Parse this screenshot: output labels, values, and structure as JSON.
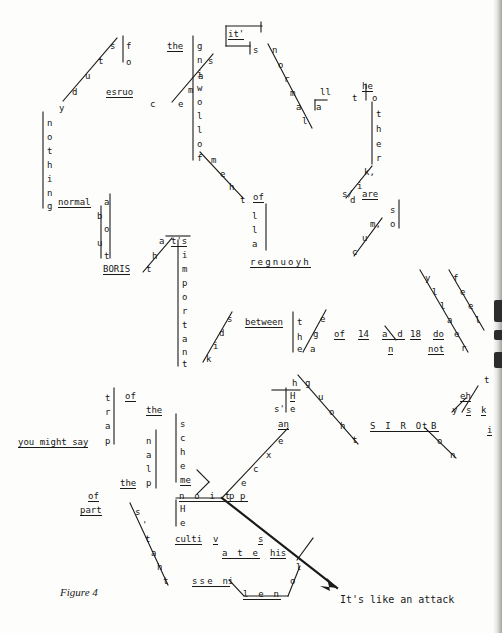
{
  "document": {
    "type": "concrete-poetry-typographic-diagram",
    "caption": "Figure 4",
    "closing_line": "It's like an attack",
    "reconstructed_text": "study of course the same it's normal the following of them all the other kids are, nothing normal about BORIS that's important of the between the age of 14 and 18 do not really feel you might say part of the principal scheme HIS thought He's an exception perception He cultivates his loneliness BORIS think sky It's like an attack",
    "page_size": {
      "width": 502,
      "height": 633
    }
  },
  "glyphs": [
    {
      "id": "g_s_diag_1",
      "text": "s",
      "x": 110,
      "y": 42
    },
    {
      "id": "g_t_diag_1",
      "text": "t",
      "x": 98,
      "y": 57
    },
    {
      "id": "g_u_diag_1",
      "text": "u",
      "x": 85,
      "y": 72
    },
    {
      "id": "g_d_diag_1",
      "text": "d",
      "x": 72,
      "y": 88
    },
    {
      "id": "g_y_diag_1",
      "text": "y",
      "x": 59,
      "y": 104
    },
    {
      "id": "g_f_of",
      "text": "f",
      "x": 126,
      "y": 42
    },
    {
      "id": "g_o_of",
      "text": "o",
      "x": 126,
      "y": 58
    },
    {
      "id": "g_esruoc_w",
      "text": "esruo",
      "x": 106,
      "y": 88
    },
    {
      "id": "g_c_esruoc",
      "text": "c",
      "x": 150,
      "y": 100
    },
    {
      "id": "g_s_same",
      "text": "s",
      "x": 208,
      "y": 57
    },
    {
      "id": "g_a_same",
      "text": "a",
      "x": 198,
      "y": 72
    },
    {
      "id": "g_m_same",
      "text": "m",
      "x": 188,
      "y": 86
    },
    {
      "id": "g_e_same",
      "text": "e",
      "x": 178,
      "y": 100
    },
    {
      "id": "g_the_1",
      "text": "the",
      "x": 167,
      "y": 42
    },
    {
      "id": "g_its_box",
      "text": "it'",
      "x": 228,
      "y": 30
    },
    {
      "id": "g_s_its",
      "text": "s",
      "x": 253,
      "y": 46
    },
    {
      "id": "g_n_normal",
      "text": "n",
      "x": 272,
      "y": 46
    },
    {
      "id": "g_o_normal",
      "text": "o",
      "x": 278,
      "y": 61
    },
    {
      "id": "g_r_normal",
      "text": "r",
      "x": 284,
      "y": 75
    },
    {
      "id": "g_m_normal",
      "text": "m",
      "x": 290,
      "y": 89
    },
    {
      "id": "g_a_normal",
      "text": "a",
      "x": 296,
      "y": 103
    },
    {
      "id": "g_l_normal",
      "text": "l",
      "x": 302,
      "y": 117
    },
    {
      "id": "g_ll",
      "text": "ll",
      "x": 320,
      "y": 88
    },
    {
      "id": "g_a_all",
      "text": "a",
      "x": 316,
      "y": 103
    },
    {
      "id": "g_he_word",
      "text": "he",
      "x": 362,
      "y": 82
    },
    {
      "id": "g_t_the2",
      "text": "t",
      "x": 352,
      "y": 94
    },
    {
      "id": "g_o_other",
      "text": "o",
      "x": 372,
      "y": 94
    },
    {
      "id": "g_t_other",
      "text": "t",
      "x": 376,
      "y": 110
    },
    {
      "id": "g_h_other",
      "text": "h",
      "x": 376,
      "y": 125
    },
    {
      "id": "g_e_other",
      "text": "e",
      "x": 376,
      "y": 140
    },
    {
      "id": "g_r_other",
      "text": "r",
      "x": 376,
      "y": 154
    },
    {
      "id": "g_k_other",
      "text": "k,",
      "x": 364,
      "y": 168
    },
    {
      "id": "g_i_kids",
      "text": "i",
      "x": 357,
      "y": 182
    },
    {
      "id": "g_d_kids",
      "text": "d",
      "x": 350,
      "y": 196
    },
    {
      "id": "g_s_kids",
      "text": "s/",
      "x": 342,
      "y": 190
    },
    {
      "id": "g_are",
      "text": "are",
      "x": 362,
      "y": 190
    },
    {
      "id": "g_s_us",
      "text": "s",
      "x": 390,
      "y": 206
    },
    {
      "id": "g_o_us",
      "text": "o",
      "x": 390,
      "y": 220
    },
    {
      "id": "g_m_much",
      "text": "m,",
      "x": 370,
      "y": 220
    },
    {
      "id": "g_u_much",
      "text": "u",
      "x": 362,
      "y": 234
    },
    {
      "id": "g_c_much",
      "text": "c",
      "x": 352,
      "y": 248
    },
    {
      "id": "g_g_foll",
      "text": "g",
      "x": 197,
      "y": 42
    },
    {
      "id": "g_n_foll",
      "text": "n",
      "x": 197,
      "y": 56
    },
    {
      "id": "g_i_foll",
      "text": "i",
      "x": 197,
      "y": 70
    },
    {
      "id": "g_w_foll",
      "text": "w",
      "x": 197,
      "y": 84
    },
    {
      "id": "g_o_foll",
      "text": "o",
      "x": 197,
      "y": 98
    },
    {
      "id": "g_l1_foll",
      "text": "l",
      "x": 197,
      "y": 112
    },
    {
      "id": "g_l2_foll",
      "text": "l",
      "x": 197,
      "y": 126
    },
    {
      "id": "g_o2_foll",
      "text": "o",
      "x": 197,
      "y": 140
    },
    {
      "id": "g_f_foll",
      "text": "f",
      "x": 197,
      "y": 154
    },
    {
      "id": "g_m_them",
      "text": "m",
      "x": 211,
      "y": 156
    },
    {
      "id": "g_e_them",
      "text": "e",
      "x": 220,
      "y": 170
    },
    {
      "id": "g_h_them",
      "text": "h",
      "x": 229,
      "y": 183
    },
    {
      "id": "g_t_them",
      "text": "t",
      "x": 240,
      "y": 196
    },
    {
      "id": "g_of_2",
      "text": "of",
      "x": 253,
      "y": 193
    },
    {
      "id": "g_l1_all2",
      "text": "l",
      "x": 252,
      "y": 212
    },
    {
      "id": "g_l2_all2",
      "text": "l",
      "x": 252,
      "y": 226
    },
    {
      "id": "g_a_all2",
      "text": "a",
      "x": 252,
      "y": 240
    },
    {
      "id": "g_younger",
      "text": "regnuoyh",
      "x": 250,
      "y": 258
    },
    {
      "id": "g_n_noth",
      "text": "n",
      "x": 47,
      "y": 119
    },
    {
      "id": "g_o_noth",
      "text": "o",
      "x": 47,
      "y": 133
    },
    {
      "id": "g_t_noth",
      "text": "t",
      "x": 47,
      "y": 147
    },
    {
      "id": "g_h_noth",
      "text": "h",
      "x": 47,
      "y": 161
    },
    {
      "id": "g_i_noth",
      "text": "i",
      "x": 47,
      "y": 175
    },
    {
      "id": "g_n2_noth",
      "text": "n",
      "x": 47,
      "y": 189
    },
    {
      "id": "g_g_noth",
      "text": "g",
      "x": 47,
      "y": 202
    },
    {
      "id": "g_normal_w",
      "text": "normal",
      "x": 58,
      "y": 198
    },
    {
      "id": "g_a_about",
      "text": "a",
      "x": 104,
      "y": 198
    },
    {
      "id": "g_b_about",
      "text": "b",
      "x": 97,
      "y": 212
    },
    {
      "id": "g_o_about",
      "text": "o",
      "x": 104,
      "y": 225
    },
    {
      "id": "g_u_about",
      "text": "u",
      "x": 97,
      "y": 239
    },
    {
      "id": "g_t_about",
      "text": "t",
      "x": 104,
      "y": 252
    },
    {
      "id": "g_boris_1",
      "text": "BORIS",
      "x": 103,
      "y": 265
    },
    {
      "id": "g_t_that",
      "text": "t",
      "x": 146,
      "y": 265
    },
    {
      "id": "g_h_that",
      "text": "h",
      "x": 152,
      "y": 252
    },
    {
      "id": "g_a_that",
      "text": "a",
      "x": 159,
      "y": 237
    },
    {
      "id": "g_ts_that",
      "text": "t's",
      "x": 171,
      "y": 237
    },
    {
      "id": "g_i_imp",
      "text": "i",
      "x": 182,
      "y": 251
    },
    {
      "id": "g_m_imp",
      "text": "m",
      "x": 182,
      "y": 265
    },
    {
      "id": "g_p_imp",
      "text": "p",
      "x": 182,
      "y": 279
    },
    {
      "id": "g_o_imp",
      "text": "o",
      "x": 182,
      "y": 293
    },
    {
      "id": "g_r_imp",
      "text": "r",
      "x": 182,
      "y": 307
    },
    {
      "id": "g_t2_imp",
      "text": "t",
      "x": 182,
      "y": 321
    },
    {
      "id": "g_a2_imp",
      "text": "a",
      "x": 182,
      "y": 335
    },
    {
      "id": "g_n_imp",
      "text": "n",
      "x": 182,
      "y": 348
    },
    {
      "id": "g_t3_imp",
      "text": "t",
      "x": 182,
      "y": 360
    },
    {
      "id": "g_s_think",
      "text": "s",
      "x": 227,
      "y": 315
    },
    {
      "id": "g_d_think",
      "text": "d",
      "x": 219,
      "y": 329
    },
    {
      "id": "g_i_think",
      "text": "i",
      "x": 213,
      "y": 342
    },
    {
      "id": "g_k_think",
      "text": "k",
      "x": 206,
      "y": 355
    },
    {
      "id": "g_between",
      "text": "between",
      "x": 245,
      "y": 318
    },
    {
      "id": "g_t_the3",
      "text": "t",
      "x": 297,
      "y": 318
    },
    {
      "id": "g_h_the3",
      "text": "h",
      "x": 297,
      "y": 333
    },
    {
      "id": "g_e_the3",
      "text": "e",
      "x": 297,
      "y": 345
    },
    {
      "id": "g_e_age",
      "text": "e",
      "x": 320,
      "y": 315
    },
    {
      "id": "g_g_age",
      "text": "g",
      "x": 313,
      "y": 330
    },
    {
      "id": "g_a_age",
      "text": "a",
      "x": 310,
      "y": 345
    },
    {
      "id": "g_of_3",
      "text": "of",
      "x": 334,
      "y": 330
    },
    {
      "id": "g_14",
      "text": "14",
      "x": 358,
      "y": 330
    },
    {
      "id": "g_ad",
      "text": "a d",
      "x": 382,
      "y": 330
    },
    {
      "id": "g_n_and",
      "text": "n",
      "x": 388,
      "y": 345
    },
    {
      "id": "g_18",
      "text": "18",
      "x": 410,
      "y": 330
    },
    {
      "id": "g_do",
      "text": "do",
      "x": 433,
      "y": 330
    },
    {
      "id": "g_not",
      "text": "not",
      "x": 428,
      "y": 345
    },
    {
      "id": "g_y_really",
      "text": "y",
      "x": 425,
      "y": 274
    },
    {
      "id": "g_l1_really",
      "text": "l",
      "x": 432,
      "y": 288
    },
    {
      "id": "g_l2_really",
      "text": "l",
      "x": 440,
      "y": 302
    },
    {
      "id": "g_a_really",
      "text": "a",
      "x": 447,
      "y": 316
    },
    {
      "id": "g_e_really",
      "text": "e",
      "x": 454,
      "y": 330
    },
    {
      "id": "g_r_really",
      "text": "r",
      "x": 461,
      "y": 344
    },
    {
      "id": "g_f_feel",
      "text": "f",
      "x": 453,
      "y": 274
    },
    {
      "id": "g_e1_feel",
      "text": "e",
      "x": 460,
      "y": 288
    },
    {
      "id": "g_e2_feel",
      "text": "e",
      "x": 468,
      "y": 302
    },
    {
      "id": "g_l_feel",
      "text": "l",
      "x": 475,
      "y": 316
    },
    {
      "id": "g_t_tail",
      "text": "t",
      "x": 484,
      "y": 376
    },
    {
      "id": "g_eh",
      "text": "eh",
      "x": 460,
      "y": 392
    },
    {
      "id": "g_y_sky",
      "text": "y",
      "x": 452,
      "y": 406
    },
    {
      "id": "g_s_sky",
      "text": "s",
      "x": 466,
      "y": 406
    },
    {
      "id": "g_k_sky",
      "text": "k",
      "x": 481,
      "y": 406
    },
    {
      "id": "g_i_tail",
      "text": "i",
      "x": 487,
      "y": 426
    },
    {
      "id": "g_you_might",
      "text": "you might say",
      "x": 18,
      "y": 438
    },
    {
      "id": "g_t_trap",
      "text": "t",
      "x": 105,
      "y": 394
    },
    {
      "id": "g_r_trap",
      "text": "r",
      "x": 105,
      "y": 408
    },
    {
      "id": "g_a_trap",
      "text": "a",
      "x": 105,
      "y": 422
    },
    {
      "id": "g_p_trap",
      "text": "p",
      "x": 105,
      "y": 437
    },
    {
      "id": "g_of_4",
      "text": "of",
      "x": 125,
      "y": 392
    },
    {
      "id": "g_the_4",
      "text": "the",
      "x": 146,
      "y": 406
    },
    {
      "id": "g_n_prin",
      "text": "n",
      "x": 146,
      "y": 437
    },
    {
      "id": "g_a_prin",
      "text": "a",
      "x": 146,
      "y": 451
    },
    {
      "id": "g_l_prin",
      "text": "l",
      "x": 146,
      "y": 465
    },
    {
      "id": "g_the_5",
      "text": "the",
      "x": 120,
      "y": 479
    },
    {
      "id": "g_p_prin",
      "text": "p",
      "x": 146,
      "y": 479
    },
    {
      "id": "g_of_5",
      "text": "of",
      "x": 88,
      "y": 492
    },
    {
      "id": "g_part",
      "text": "part",
      "x": 80,
      "y": 506
    },
    {
      "id": "g_s_sch",
      "text": "s",
      "x": 180,
      "y": 420
    },
    {
      "id": "g_c_sch",
      "text": "c",
      "x": 180,
      "y": 434
    },
    {
      "id": "g_h_sch",
      "text": "h",
      "x": 180,
      "y": 448
    },
    {
      "id": "g_e_sch",
      "text": "e",
      "x": 180,
      "y": 462
    },
    {
      "id": "g_me_sch",
      "text": "me",
      "x": 180,
      "y": 476
    },
    {
      "id": "g_percep",
      "text": "n o i t p",
      "x": 179,
      "y": 492
    },
    {
      "id": "g_H_he2",
      "text": "H",
      "x": 180,
      "y": 505
    },
    {
      "id": "g_e_he2",
      "text": "e",
      "x": 180,
      "y": 519
    },
    {
      "id": "g_h_thought",
      "text": "h",
      "x": 292,
      "y": 379
    },
    {
      "id": "g_g_thought",
      "text": "g",
      "x": 305,
      "y": 379
    },
    {
      "id": "g_u_thought",
      "text": "u",
      "x": 318,
      "y": 393
    },
    {
      "id": "g_o_thought",
      "text": "o",
      "x": 329,
      "y": 408
    },
    {
      "id": "g_h2_thought",
      "text": "h",
      "x": 340,
      "y": 422
    },
    {
      "id": "g_t_thought",
      "text": "t",
      "x": 352,
      "y": 436
    },
    {
      "id": "g_H_his",
      "text": "H",
      "x": 290,
      "y": 392
    },
    {
      "id": "g_s_hes",
      "text": "s'",
      "x": 274,
      "y": 405
    },
    {
      "id": "g_e_hes",
      "text": "e",
      "x": 290,
      "y": 405
    },
    {
      "id": "g_an",
      "text": "an",
      "x": 278,
      "y": 420
    },
    {
      "id": "g_e_exc",
      "text": "e",
      "x": 278,
      "y": 437
    },
    {
      "id": "g_x_exc",
      "text": "x",
      "x": 266,
      "y": 451
    },
    {
      "id": "g_c_exc",
      "text": "c",
      "x": 253,
      "y": 465
    },
    {
      "id": "g_e2_exc",
      "text": "e",
      "x": 241,
      "y": 479
    },
    {
      "id": "g_p_exc",
      "text": "p",
      "x": 229,
      "y": 492
    },
    {
      "id": "g_boris_2",
      "text": "S I R O B",
      "x": 370,
      "y": 422
    },
    {
      "id": "g_t_boris2",
      "text": "t",
      "x": 422,
      "y": 422
    },
    {
      "id": "g_o_boris2",
      "text": "o",
      "x": 437,
      "y": 437
    },
    {
      "id": "g_n_boris2",
      "text": "n",
      "x": 450,
      "y": 451
    },
    {
      "id": "g_s_thats",
      "text": "s",
      "x": 135,
      "y": 508
    },
    {
      "id": "g_apos",
      "text": "'",
      "x": 142,
      "y": 521
    },
    {
      "id": "g_t_thats",
      "text": "t",
      "x": 145,
      "y": 535
    },
    {
      "id": "g_a_thats",
      "text": "a",
      "x": 151,
      "y": 549
    },
    {
      "id": "g_h_thats",
      "text": "h",
      "x": 157,
      "y": 563
    },
    {
      "id": "g_t2_thats",
      "text": "t",
      "x": 163,
      "y": 577
    },
    {
      "id": "g_culti",
      "text": "culti",
      "x": 175,
      "y": 535
    },
    {
      "id": "g_v_cult",
      "text": "v",
      "x": 213,
      "y": 535
    },
    {
      "id": "g_ate",
      "text": "a t e",
      "x": 222,
      "y": 549
    },
    {
      "id": "g_s_cult",
      "text": "s",
      "x": 258,
      "y": 535
    },
    {
      "id": "g_his",
      "text": "his",
      "x": 270,
      "y": 549
    },
    {
      "id": "g_ssen",
      "text": "sse n",
      "x": 192,
      "y": 577
    },
    {
      "id": "g_i_lone",
      "text": "i",
      "x": 228,
      "y": 577
    },
    {
      "id": "g_len",
      "text": "l e n",
      "x": 243,
      "y": 590
    },
    {
      "id": "g_o_lone",
      "text": "o",
      "x": 290,
      "y": 577
    },
    {
      "id": "g_l_lone",
      "text": "l",
      "x": 296,
      "y": 563
    }
  ],
  "underlined_ids": [
    "g_esruoc_w",
    "g_the_1",
    "g_its_box",
    "g_he_word",
    "g_are",
    "g_of_2",
    "g_younger",
    "g_normal_w",
    "g_boris_1",
    "g_ts_that",
    "g_between",
    "g_of_3",
    "g_14",
    "g_ad",
    "g_n_and",
    "g_18",
    "g_do",
    "g_not",
    "g_you_might",
    "g_of_4",
    "g_the_4",
    "g_the_5",
    "g_of_5",
    "g_part",
    "g_me_sch",
    "g_percep",
    "g_H_his",
    "g_an",
    "g_boris_2",
    "g_culti",
    "g_v_cult",
    "g_ate",
    "g_s_cult",
    "g_his",
    "g_ssen",
    "g_len",
    "g_s_sky",
    "g_k_sky",
    "g_i_tail",
    "g_eh"
  ],
  "caption": {
    "label": "Figure 4",
    "x": 60,
    "y": 592
  },
  "closing": {
    "label": "It's like an attack",
    "x": 340,
    "y": 600
  },
  "colors": {
    "ink": "#161616",
    "paper": "#fdfdfc",
    "scan_edge": "#96928f"
  }
}
